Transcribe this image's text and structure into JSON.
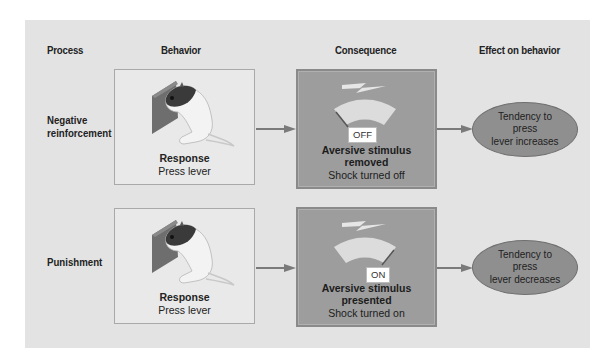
{
  "headers": {
    "process": "Process",
    "behavior": "Behavior",
    "consequence": "Consequence",
    "effect": "Effect on behavior"
  },
  "rows": [
    {
      "process": "Negative reinforcement",
      "process_line1": "Negative",
      "process_line2": "reinforcement",
      "behavior_title": "Response",
      "behavior_sub": "Press lever",
      "consequence_state": "OFF",
      "consequence_title_line1": "Aversive stimulus",
      "consequence_title_line2": "removed",
      "consequence_sub": "Shock turned off",
      "effect_line1": "Tendency to press",
      "effect_line2": "lever increases"
    },
    {
      "process": "Punishment",
      "process_line1": "Punishment",
      "process_line2": "",
      "behavior_title": "Response",
      "behavior_sub": "Press lever",
      "consequence_state": "ON",
      "consequence_title_line1": "Aversive stimulus",
      "consequence_title_line2": "presented",
      "consequence_sub": "Shock turned on",
      "effect_line1": "Tendency to press",
      "effect_line2": "lever decreases"
    }
  ],
  "icons": {
    "behavior": "rat-pressing-lever-icon",
    "consequence": "shock-meter-icon",
    "lightning": "lightning-bolt-icon",
    "arrow": "arrow-right-icon"
  },
  "colors": {
    "panel": "#e3e3e3",
    "behavior_box": "#e9e9e9",
    "consequence_box": "#9d9d9d",
    "effect_ellipse": "#8f8f8f",
    "arrow": "#7a7a7a"
  }
}
